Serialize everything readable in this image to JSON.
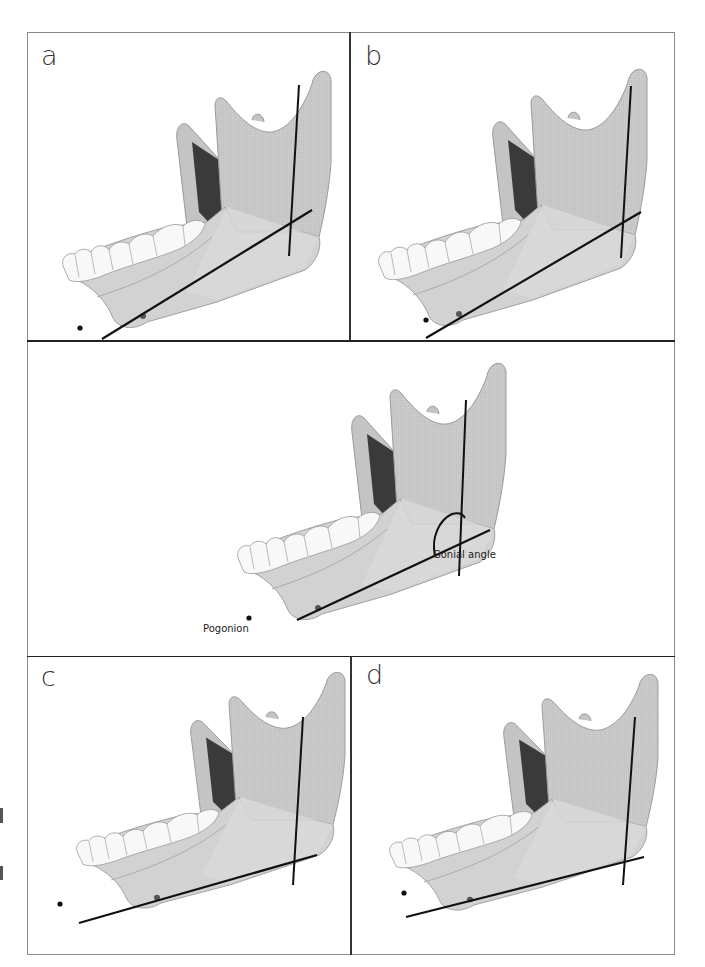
{
  "figure": {
    "panels": [
      {
        "id": "a",
        "label": "a"
      },
      {
        "id": "b",
        "label": "b"
      },
      {
        "id": "center",
        "label": ""
      },
      {
        "id": "c",
        "label": "c"
      },
      {
        "id": "d",
        "label": "d"
      }
    ],
    "annotations": {
      "gonial_angle": "Gonial angle",
      "pogonion": "Pogonion"
    },
    "colors": {
      "bone": "#c9c9c9",
      "bone_light": "#d8d8d8",
      "bone_shadow": "#a9a9a9",
      "cavity": "#3a3a3a",
      "teeth": "#f7f7f7",
      "lines": "#111111",
      "frame": "#8a8a8a"
    }
  }
}
